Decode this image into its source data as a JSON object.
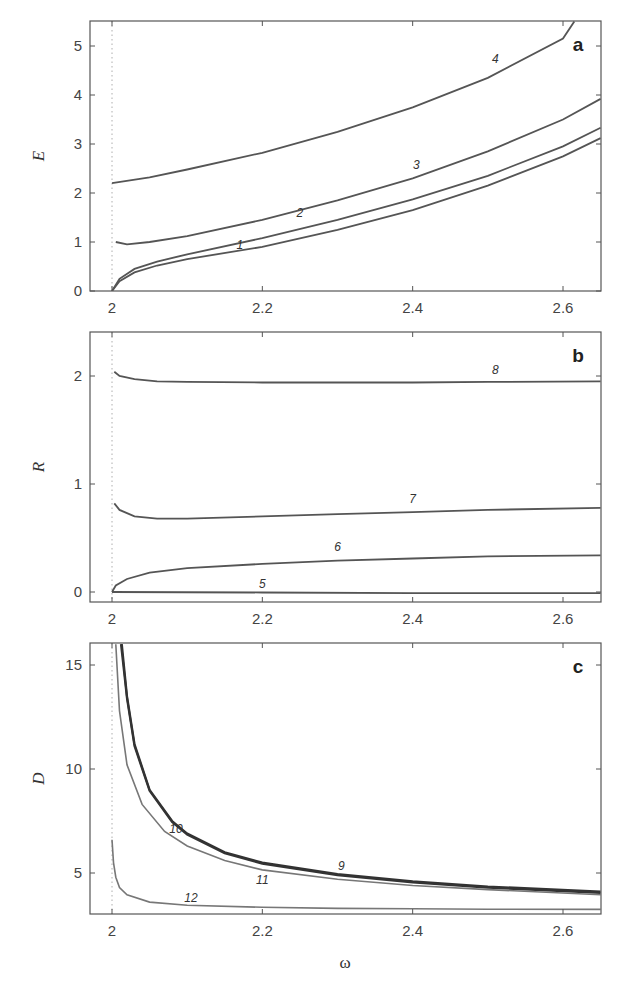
{
  "chart_data": [
    {
      "type": "line",
      "panel": "a",
      "ylabel": "E",
      "xlabel": "",
      "xlim": [
        1.97,
        2.65
      ],
      "ylim": [
        0,
        5.5
      ],
      "xticks": [
        2,
        2.2,
        2.4,
        2.6
      ],
      "xtick_labels": [
        "2",
        "2.2",
        "2.4",
        "2.6"
      ],
      "yticks": [
        0,
        1,
        2,
        3,
        4,
        5
      ],
      "ytick_labels": [
        "0",
        "1",
        "2",
        "3",
        "4",
        "5"
      ],
      "vline_dotted": 2,
      "series": [
        {
          "name": "1",
          "x": [
            2.0,
            2.01,
            2.03,
            2.06,
            2.1,
            2.2,
            2.3,
            2.4,
            2.5,
            2.6,
            2.65
          ],
          "values": [
            0.0,
            0.2,
            0.38,
            0.52,
            0.65,
            0.9,
            1.25,
            1.65,
            2.15,
            2.75,
            3.12
          ]
        },
        {
          "name": "2",
          "x": [
            2.0,
            2.01,
            2.03,
            2.06,
            2.1,
            2.2,
            2.3,
            2.4,
            2.5,
            2.6,
            2.65
          ],
          "values": [
            0.0,
            0.25,
            0.45,
            0.6,
            0.75,
            1.08,
            1.45,
            1.87,
            2.35,
            2.95,
            3.33
          ]
        },
        {
          "name": "3",
          "x": [
            2.005,
            2.02,
            2.05,
            2.1,
            2.2,
            2.3,
            2.4,
            2.5,
            2.6,
            2.65
          ],
          "values": [
            1.0,
            0.95,
            1.0,
            1.12,
            1.45,
            1.85,
            2.3,
            2.85,
            3.5,
            3.92
          ]
        },
        {
          "name": "4",
          "x": [
            2.0,
            2.05,
            2.1,
            2.2,
            2.3,
            2.4,
            2.5,
            2.6,
            2.615
          ],
          "values": [
            2.2,
            2.32,
            2.48,
            2.82,
            3.25,
            3.75,
            4.35,
            5.15,
            5.5
          ]
        }
      ],
      "curve_labels": [
        {
          "text": "1",
          "x": 2.17,
          "y": 0.85
        },
        {
          "text": "2",
          "x": 2.25,
          "y": 1.52
        },
        {
          "text": "3",
          "x": 2.405,
          "y": 2.48
        },
        {
          "text": "4",
          "x": 2.51,
          "y": 4.65
        }
      ],
      "panel_letter": "a"
    },
    {
      "type": "line",
      "panel": "b",
      "ylabel": "R",
      "xlabel": "",
      "xlim": [
        1.97,
        2.65
      ],
      "ylim": [
        -0.09,
        2.4
      ],
      "xticks": [
        2,
        2.2,
        2.4,
        2.6
      ],
      "xtick_labels": [
        "2",
        "2.2",
        "2.4",
        "2.6"
      ],
      "yticks": [
        0,
        1,
        2
      ],
      "ytick_labels": [
        "0",
        "1",
        "2"
      ],
      "vline_dotted": 2,
      "series": [
        {
          "name": "5",
          "x": [
            2.0,
            2.2,
            2.4,
            2.65
          ],
          "values": [
            0.0,
            -0.005,
            -0.01,
            -0.01
          ]
        },
        {
          "name": "6",
          "x": [
            2.0,
            2.005,
            2.02,
            2.05,
            2.1,
            2.2,
            2.3,
            2.4,
            2.5,
            2.65
          ],
          "values": [
            0.0,
            0.06,
            0.12,
            0.18,
            0.22,
            0.26,
            0.29,
            0.31,
            0.33,
            0.34
          ]
        },
        {
          "name": "7",
          "x": [
            2.003,
            2.01,
            2.03,
            2.06,
            2.1,
            2.2,
            2.3,
            2.4,
            2.5,
            2.65
          ],
          "values": [
            0.82,
            0.76,
            0.7,
            0.68,
            0.68,
            0.7,
            0.72,
            0.74,
            0.76,
            0.78
          ]
        },
        {
          "name": "8",
          "x": [
            2.003,
            2.01,
            2.03,
            2.06,
            2.1,
            2.2,
            2.3,
            2.4,
            2.5,
            2.65
          ],
          "values": [
            2.04,
            2.0,
            1.97,
            1.95,
            1.945,
            1.94,
            1.94,
            1.94,
            1.945,
            1.95
          ]
        }
      ],
      "curve_labels": [
        {
          "text": "5",
          "x": 2.2,
          "y": 0.04
        },
        {
          "text": "6",
          "x": 2.3,
          "y": 0.38
        },
        {
          "text": "7",
          "x": 2.4,
          "y": 0.82
        },
        {
          "text": "8",
          "x": 2.51,
          "y": 2.02
        }
      ],
      "panel_letter": "b"
    },
    {
      "type": "line",
      "panel": "c",
      "ylabel": "D",
      "xlabel": "ω",
      "xlim": [
        1.97,
        2.65
      ],
      "ylim": [
        3.0,
        16.0
      ],
      "xticks": [
        2,
        2.2,
        2.4,
        2.6
      ],
      "xtick_labels": [
        "2",
        "2.2",
        "2.4",
        "2.6"
      ],
      "yticks": [
        5,
        10,
        15
      ],
      "ytick_labels": [
        "5",
        "10",
        "15"
      ],
      "vline_dotted": 2,
      "series": [
        {
          "name": "9",
          "x": [
            2.013,
            2.02,
            2.03,
            2.05,
            2.08,
            2.1,
            2.15,
            2.2,
            2.3,
            2.4,
            2.5,
            2.65
          ],
          "values": [
            16.0,
            13.5,
            11.2,
            9.0,
            7.5,
            6.9,
            6.0,
            5.5,
            4.95,
            4.6,
            4.35,
            4.1
          ]
        },
        {
          "name": "10",
          "x": [
            2.012,
            2.02,
            2.03,
            2.05,
            2.08,
            2.1,
            2.15,
            2.2,
            2.3,
            2.4,
            2.5,
            2.65
          ],
          "values": [
            16.0,
            13.4,
            11.1,
            8.95,
            7.45,
            6.85,
            5.95,
            5.45,
            4.9,
            4.55,
            4.3,
            4.05
          ]
        },
        {
          "name": "11",
          "x": [
            2.005,
            2.01,
            2.02,
            2.04,
            2.07,
            2.1,
            2.15,
            2.2,
            2.3,
            2.4,
            2.5,
            2.65
          ],
          "values": [
            16.0,
            12.8,
            10.2,
            8.3,
            7.0,
            6.3,
            5.6,
            5.15,
            4.7,
            4.4,
            4.2,
            3.95
          ]
        },
        {
          "name": "12",
          "x": [
            2.0,
            2.002,
            2.005,
            2.01,
            2.02,
            2.05,
            2.1,
            2.2,
            2.3,
            2.4,
            2.5,
            2.65
          ],
          "values": [
            6.6,
            5.5,
            4.8,
            4.3,
            3.95,
            3.6,
            3.45,
            3.35,
            3.3,
            3.28,
            3.26,
            3.25
          ]
        }
      ],
      "curve_labels": [
        {
          "text": "10",
          "x": 2.085,
          "y": 6.9
        },
        {
          "text": "9",
          "x": 2.305,
          "y": 5.15
        },
        {
          "text": "11",
          "x": 2.2,
          "y": 4.45
        },
        {
          "text": "12",
          "x": 2.105,
          "y": 3.6
        }
      ],
      "panel_letter": "c"
    }
  ],
  "figure": {
    "xlabel": "ω"
  }
}
